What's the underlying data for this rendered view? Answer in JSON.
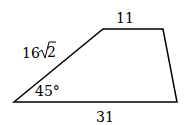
{
  "diagram": {
    "shape": "trapezoid",
    "labels": {
      "top": "11",
      "bottom": "31",
      "left_side_coef": "16",
      "left_side_radicand": "2",
      "angle": "45°"
    },
    "vertices": {
      "bottom_left": [
        14,
        102
      ],
      "top_left": [
        103,
        29
      ],
      "top_right": [
        163,
        29
      ],
      "bottom_right": [
        177,
        102
      ]
    },
    "stroke_color": "#000000"
  }
}
